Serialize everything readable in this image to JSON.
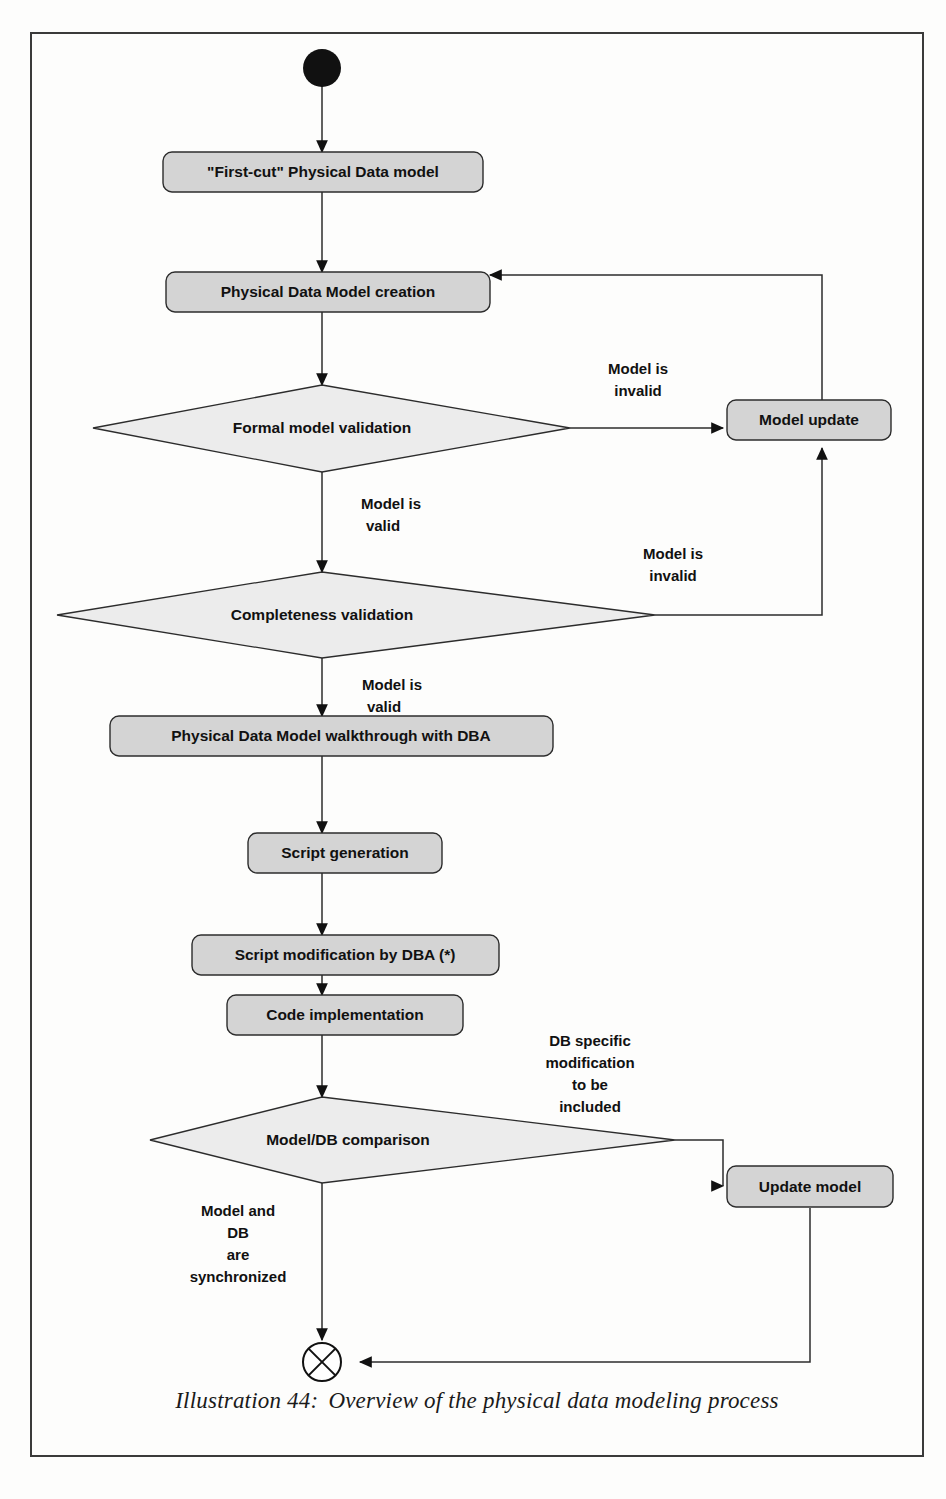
{
  "figure": {
    "caption_label": "Illustration 44:",
    "caption_text": "Overview of the physical data modeling process"
  },
  "diagram": {
    "type": "uml-activity-diagram",
    "title": "Overview of the physical data modeling process",
    "colors": {
      "activity_fill": "#d4d4d4",
      "decision_fill": "#ececec",
      "stroke": "#2c2c2c",
      "text": "#111111",
      "frame": "#3a3a3a",
      "page_background": "#fdfdfc"
    },
    "nodes": [
      {
        "id": "start",
        "kind": "initial-node",
        "label": ""
      },
      {
        "id": "first-cut",
        "kind": "activity",
        "label": "\"First-cut\" Physical Data model"
      },
      {
        "id": "pdm-creation",
        "kind": "activity",
        "label": "Physical Data Model creation"
      },
      {
        "id": "formal-validation",
        "kind": "decision",
        "label": "Formal model validation"
      },
      {
        "id": "completeness-validation",
        "kind": "decision",
        "label": "Completeness validation"
      },
      {
        "id": "model-update",
        "kind": "activity",
        "label": "Model update"
      },
      {
        "id": "walkthrough",
        "kind": "activity",
        "label": "Physical Data Model walkthrough with DBA"
      },
      {
        "id": "script-generation",
        "kind": "activity",
        "label": "Script generation"
      },
      {
        "id": "script-modification",
        "kind": "activity",
        "label": "Script modification by DBA (*)"
      },
      {
        "id": "code-implementation",
        "kind": "activity",
        "label": "Code implementation"
      },
      {
        "id": "model-db-comparison",
        "kind": "decision",
        "label": "Model/DB comparison"
      },
      {
        "id": "update-model",
        "kind": "activity",
        "label": "Update model"
      },
      {
        "id": "end",
        "kind": "final-node",
        "label": ""
      }
    ],
    "edge_labels": {
      "formal_invalid": "Model is\ninvalid",
      "formal_invalid_line1": "Model is",
      "formal_invalid_line2": "invalid",
      "formal_valid_line1": "Model is",
      "formal_valid_line2": "valid",
      "completeness_invalid_line1": "Model is",
      "completeness_invalid_line2": "invalid",
      "completeness_valid_line1": "Model is",
      "completeness_valid_line2": "valid",
      "db_specific_line1": "DB specific",
      "db_specific_line2": "modification",
      "db_specific_line3": "to be",
      "db_specific_line4": "included",
      "synchronized_line1": "Model and",
      "synchronized_line2": "DB",
      "synchronized_line3": "are",
      "synchronized_line4": "synchronized"
    },
    "edges": [
      {
        "from": "start",
        "to": "first-cut",
        "label": ""
      },
      {
        "from": "first-cut",
        "to": "pdm-creation",
        "label": ""
      },
      {
        "from": "pdm-creation",
        "to": "formal-validation",
        "label": ""
      },
      {
        "from": "formal-validation",
        "to": "model-update",
        "label": "Model is invalid"
      },
      {
        "from": "formal-validation",
        "to": "completeness-validation",
        "label": "Model is valid"
      },
      {
        "from": "completeness-validation",
        "to": "model-update",
        "label": "Model is invalid"
      },
      {
        "from": "model-update",
        "to": "pdm-creation",
        "label": ""
      },
      {
        "from": "completeness-validation",
        "to": "walkthrough",
        "label": "Model is valid"
      },
      {
        "from": "walkthrough",
        "to": "script-generation",
        "label": ""
      },
      {
        "from": "script-generation",
        "to": "script-modification",
        "label": ""
      },
      {
        "from": "script-modification",
        "to": "code-implementation",
        "label": ""
      },
      {
        "from": "code-implementation",
        "to": "model-db-comparison",
        "label": ""
      },
      {
        "from": "model-db-comparison",
        "to": "update-model",
        "label": "DB specific modification to be included"
      },
      {
        "from": "model-db-comparison",
        "to": "end",
        "label": "Model and DB are synchronized"
      },
      {
        "from": "update-model",
        "to": "end",
        "label": ""
      }
    ]
  }
}
